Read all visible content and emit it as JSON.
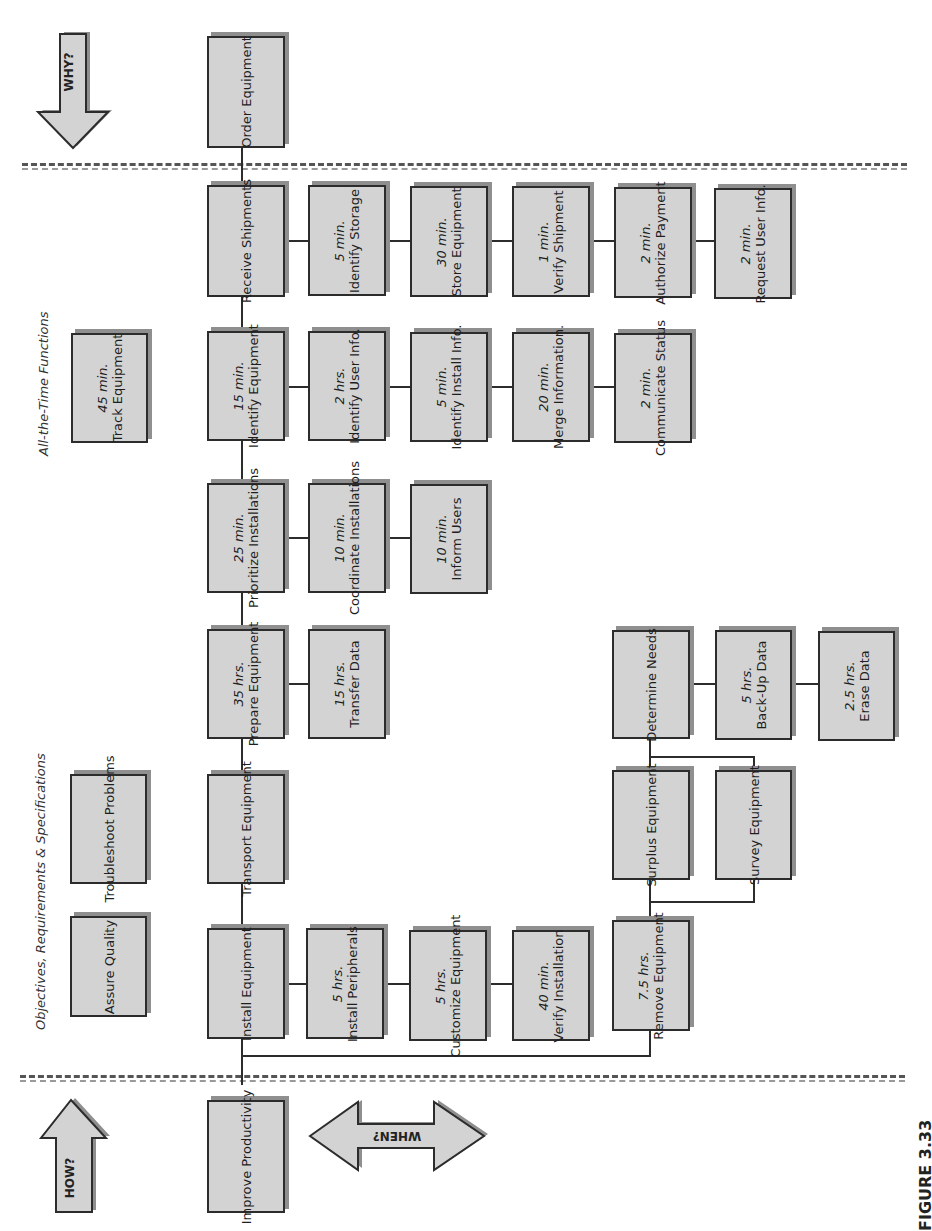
{
  "figure_label": "FIGURE 3.33",
  "direction_arrows": {
    "why": "WHY?",
    "how": "HOW?",
    "when": "WHEN?"
  },
  "notes": {
    "all_the_time": "All-the-Time Functions",
    "objectives": "Objectives, Requirements & Specifications"
  },
  "colors": {
    "box_fill": "#d3d3d3",
    "box_border": "#2c2c2c",
    "box_shadow": "#8f8f8f"
  },
  "boxes": {
    "order_equipment": {
      "time": "",
      "label": "Order Equipment"
    },
    "receive_shipments": {
      "time": "",
      "label": "Receive Shipments"
    },
    "identify_storage": {
      "time": "5 min.",
      "label": "Identify Storage"
    },
    "store_equipment": {
      "time": "30 min.",
      "label": "Store Equipment"
    },
    "verify_shipment": {
      "time": "1 min.",
      "label": "Verify Shipment"
    },
    "authorize_payment": {
      "time": "2 min.",
      "label": "Authorize Payment"
    },
    "request_user_info": {
      "time": "2 min.",
      "label": "Request User Info."
    },
    "track_equipment": {
      "time": "45 min.",
      "label": "Track Equipment"
    },
    "identify_equipment": {
      "time": "15 min.",
      "label": "Identify Equipment"
    },
    "identify_user_info": {
      "time": "2 hrs.",
      "label": "Identify User Info."
    },
    "identify_install_info": {
      "time": "5 min.",
      "label": "Identify Install Info."
    },
    "merge_information": {
      "time": "20 min.",
      "label": "Merge Information."
    },
    "communicate_status": {
      "time": "2 min.",
      "label": "Communicate Status"
    },
    "prioritize_installations": {
      "time": "25 min.",
      "label": "Prioritize Installations"
    },
    "coordinate_installations": {
      "time": "10 min.",
      "label": "Coordinate Installations"
    },
    "inform_users": {
      "time": "10 min.",
      "label": "Inform Users"
    },
    "prepare_equipment": {
      "time": "35 hrs.",
      "label": "Prepare Equipment"
    },
    "transfer_data": {
      "time": "15 hrs.",
      "label": "Transfer Data"
    },
    "determine_needs": {
      "time": "",
      "label": "Determine Needs"
    },
    "back_up_data": {
      "time": "5 hrs.",
      "label": "Back-Up Data"
    },
    "erase_data": {
      "time": "2.5 hrs.",
      "label": "Erase Data"
    },
    "troubleshoot_problems": {
      "time": "",
      "label": "Troubleshoot Problems"
    },
    "transport_equipment": {
      "time": "",
      "label": "Transport Equipment"
    },
    "surplus_equipment": {
      "time": "",
      "label": "Surplus Equipment"
    },
    "survey_equipment": {
      "time": "",
      "label": "Survey Equipment"
    },
    "assure_quality": {
      "time": "",
      "label": "Assure Quality"
    },
    "install_equipment": {
      "time": "",
      "label": "Install Equipment"
    },
    "install_peripherals": {
      "time": "5 hrs.",
      "label": "Install Peripherals"
    },
    "customize_equipment": {
      "time": "5 hrs.",
      "label": "Customize Equipment"
    },
    "verify_installation": {
      "time": "40 min.",
      "label": "Verify Installation"
    },
    "remove_equipment": {
      "time": "7.5 hrs.",
      "label": "Remove Equipment"
    },
    "improve_productivity": {
      "time": "",
      "label": "Improve Productivity"
    }
  }
}
